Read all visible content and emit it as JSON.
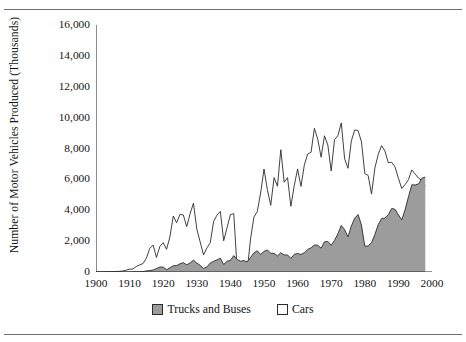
{
  "figure": {
    "top_rule": "",
    "bottom_rule": ""
  },
  "chart_data": {
    "type": "area",
    "title": "",
    "xlabel": "",
    "ylabel": "Number of Motor Vehicles Produced (Thousands)",
    "xlim": [
      1900,
      2000
    ],
    "ylim": [
      0,
      16000
    ],
    "grid": false,
    "legend_position": "bottom-center",
    "y_ticks": [
      0,
      2000,
      4000,
      6000,
      8000,
      10000,
      12000,
      14000,
      16000
    ],
    "y_tick_labels": [
      "0",
      "2,000",
      "4,000",
      "6,000",
      "8,000",
      "10,000",
      "12,000",
      "14,000",
      "16,000"
    ],
    "x_ticks": [
      1900,
      1910,
      1920,
      1930,
      1940,
      1950,
      1960,
      1970,
      1980,
      1990,
      2000
    ],
    "x_tick_labels": [
      "1900",
      "1910",
      "1920",
      "1930",
      "1940",
      "1950",
      "1960",
      "1970",
      "1980",
      "1990",
      "2000"
    ],
    "x_minor_tick_interval": 5,
    "colors": {
      "trucks_fill": "#9c9c9c",
      "trucks_line": "#2b2b2b",
      "cars_fill": "#ffffff",
      "cars_line": "#2b2b2b",
      "axis": "#2b2b2b",
      "rule": "#6f6f6f"
    },
    "legend": [
      {
        "name": "Trucks and Buses",
        "marker": "filled-gray-square"
      },
      {
        "name": "Cars",
        "marker": "open-white-square"
      }
    ],
    "x": [
      1900,
      1901,
      1902,
      1903,
      1904,
      1905,
      1906,
      1907,
      1908,
      1909,
      1910,
      1911,
      1912,
      1913,
      1914,
      1915,
      1916,
      1917,
      1918,
      1919,
      1920,
      1921,
      1922,
      1923,
      1924,
      1925,
      1926,
      1927,
      1928,
      1929,
      1930,
      1931,
      1932,
      1933,
      1934,
      1935,
      1936,
      1937,
      1938,
      1939,
      1940,
      1941,
      1942,
      1943,
      1944,
      1945,
      1946,
      1947,
      1948,
      1949,
      1950,
      1951,
      1952,
      1953,
      1954,
      1955,
      1956,
      1957,
      1958,
      1959,
      1960,
      1961,
      1962,
      1963,
      1964,
      1965,
      1966,
      1967,
      1968,
      1969,
      1970,
      1971,
      1972,
      1973,
      1974,
      1975,
      1976,
      1977,
      1978,
      1979,
      1980,
      1981,
      1982,
      1983,
      1984,
      1985,
      1986,
      1987,
      1988,
      1989,
      1990,
      1991,
      1992,
      1993,
      1994,
      1995,
      1996,
      1997,
      1998
    ],
    "series": [
      {
        "name": "Cars",
        "style": "line-unfilled",
        "values": [
          4,
          7,
          9,
          11,
          22,
          24,
          33,
          43,
          64,
          124,
          181,
          199,
          356,
          461,
          548,
          896,
          1526,
          1746,
          943,
          1652,
          1906,
          1468,
          2274,
          3625,
          3186,
          3735,
          3692,
          2937,
          3775,
          4455,
          2787,
          1948,
          1104,
          1560,
          1887,
          3273,
          3679,
          3929,
          2020,
          2867,
          3717,
          3780,
          223,
          0,
          0,
          70,
          2149,
          3558,
          3909,
          5119,
          6666,
          5338,
          4321,
          6117,
          5559,
          7920,
          5816,
          6113,
          4258,
          5591,
          6675,
          5543,
          6933,
          7638,
          7752,
          9306,
          8598,
          7437,
          8822,
          8224,
          6547,
          8584,
          8824,
          9658,
          7331,
          6717,
          8498,
          9201,
          9165,
          8434,
          6376,
          6255,
          5049,
          6739,
          7621,
          8185,
          7829,
          7085,
          7105,
          6807,
          6077,
          5407,
          5663,
          5981,
          6614,
          6340,
          6083,
          5927,
          5554
        ]
      },
      {
        "name": "Trucks and Buses",
        "style": "area-filled",
        "values": [
          0,
          0,
          0,
          0,
          0,
          0,
          2,
          3,
          4,
          3,
          6,
          11,
          22,
          24,
          25,
          74,
          92,
          128,
          227,
          316,
          322,
          148,
          269,
          409,
          417,
          531,
          609,
          465,
          583,
          771,
          575,
          433,
          228,
          330,
          576,
          697,
          782,
          891,
          488,
          700,
          754,
          1061,
          819,
          700,
          737,
          656,
          941,
          1239,
          1376,
          1134,
          1337,
          1427,
          1218,
          1206,
          1042,
          1249,
          1104,
          1107,
          877,
          1142,
          1202,
          1134,
          1249,
          1463,
          1562,
          1752,
          1731,
          1539,
          1952,
          1982,
          1733,
          2053,
          2482,
          3015,
          2746,
          2272,
          2980,
          3489,
          3722,
          3046,
          1667,
          1689,
          1905,
          2424,
          3075,
          3464,
          3488,
          3712,
          4119,
          4061,
          3702,
          3372,
          4042,
          4871,
          5649,
          5635,
          5712,
          6077,
          6150
        ]
      }
    ],
    "annotations": [
      {
        "text": "WWII production halt",
        "x_range": [
          1942,
          1945
        ]
      }
    ]
  }
}
